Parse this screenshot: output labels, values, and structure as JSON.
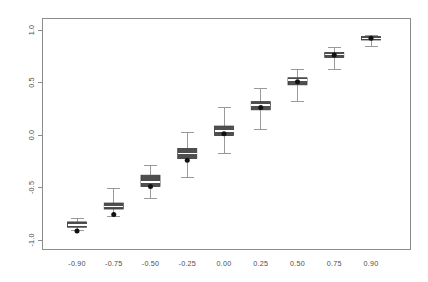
{
  "chart_data": {
    "type": "box",
    "title": "",
    "xlabel": "",
    "ylabel": "",
    "categories": [
      "-0.90",
      "-0.75",
      "-0.50",
      "-0.25",
      "0.00",
      "0.25",
      "0.50",
      "0.75",
      "0.90"
    ],
    "x_tick_labels": [
      "-0.90",
      "-0.75",
      "-0.50",
      "-0.25",
      "0.00",
      "0.25",
      "0.50",
      "0.75",
      "0.90"
    ],
    "y_tick_labels": [
      "1.0",
      "0.5",
      "0.0",
      "-0.5",
      "-1.0"
    ],
    "y_ticks": [
      1.0,
      0.5,
      0.0,
      -0.5,
      -1.0
    ],
    "ylim": [
      -1.05,
      1.08
    ],
    "grid": false,
    "legend": null,
    "box_fill_color": "#4f4f4f",
    "median_color": "#ffffff",
    "whisker_color": "#8f8f8f",
    "mean_marker_color": "#111111",
    "axis_color": "#8c8c8c",
    "boxes": [
      {
        "category": "-0.90",
        "whisker_low": -0.905,
        "q1": -0.878,
        "median": -0.855,
        "q3": -0.828,
        "whisker_high": -0.795,
        "mean": -0.915
      },
      {
        "category": "-0.75",
        "whisker_low": -0.775,
        "q1": -0.705,
        "median": -0.68,
        "q3": -0.648,
        "whisker_high": -0.505,
        "mean": -0.757
      },
      {
        "category": "-0.50",
        "whisker_low": -0.6,
        "q1": -0.49,
        "median": -0.448,
        "q3": -0.383,
        "whisker_high": -0.29,
        "mean": -0.49
      },
      {
        "category": "-0.25",
        "whisker_low": -0.405,
        "q1": -0.225,
        "median": -0.178,
        "q3": -0.128,
        "whisker_high": 0.028,
        "mean": -0.24
      },
      {
        "category": "0.00",
        "whisker_low": -0.18,
        "q1": -0.005,
        "median": 0.038,
        "q3": 0.085,
        "whisker_high": 0.258,
        "mean": 0.012
      },
      {
        "category": "0.25",
        "whisker_low": 0.055,
        "q1": 0.24,
        "median": 0.288,
        "q3": 0.318,
        "whisker_high": 0.44,
        "mean": 0.262
      },
      {
        "category": "0.50",
        "whisker_low": 0.32,
        "q1": 0.478,
        "median": 0.525,
        "q3": 0.545,
        "whisker_high": 0.625,
        "mean": 0.508
      },
      {
        "category": "0.75",
        "whisker_low": 0.625,
        "q1": 0.738,
        "median": 0.768,
        "q3": 0.785,
        "whisker_high": 0.838,
        "mean": 0.762
      },
      {
        "category": "0.90",
        "whisker_low": 0.845,
        "q1": 0.905,
        "median": 0.92,
        "q3": 0.938,
        "whisker_high": 0.952,
        "mean": 0.922
      }
    ]
  }
}
